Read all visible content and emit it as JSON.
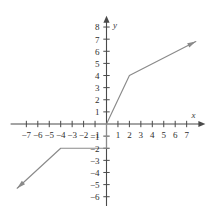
{
  "chart_data": {
    "type": "line",
    "title": "",
    "xlabel": "x",
    "ylabel": "y",
    "xlim": [
      -8.2,
      8.2
    ],
    "ylim": [
      -6.6,
      8.6
    ],
    "grid": false,
    "legend": null,
    "x_ticks": [
      -7,
      -6,
      -5,
      -4,
      -3,
      -2,
      -1,
      1,
      2,
      3,
      4,
      5,
      6,
      7
    ],
    "y_ticks": [
      -6,
      -5,
      -4,
      -3,
      -2,
      -1,
      1,
      2,
      3,
      4,
      5,
      6,
      7,
      8
    ],
    "x_tick_labels": [
      "−7",
      "−6",
      "−5",
      "−4",
      "−3",
      "−2",
      "−1",
      "1",
      "2",
      "3",
      "4",
      "5",
      "6",
      "7"
    ],
    "y_tick_labels": [
      "−6",
      "−5",
      "−4",
      "−3",
      "−2",
      "−1",
      "1",
      "2",
      "3",
      "4",
      "5",
      "6",
      "7",
      "8"
    ],
    "series": [
      {
        "name": "piecewise-function",
        "points": [
          [
            -7.8,
            -5.3
          ],
          [
            -4,
            -2
          ],
          [
            0,
            -2
          ],
          [
            0,
            0
          ],
          [
            2,
            4
          ],
          [
            7.8,
            6.8
          ]
        ],
        "arrow_start": true,
        "arrow_end": true,
        "color": "#8a8a8a"
      }
    ],
    "axis_color": "#4a4a4a",
    "axis_arrows": {
      "x_positive": true,
      "y_positive": true
    }
  },
  "labels": {
    "x_axis": "x",
    "y_axis": "y"
  }
}
